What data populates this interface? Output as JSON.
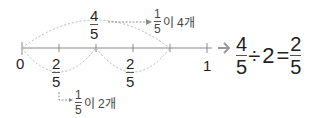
{
  "number_line": {
    "ticks": [
      {
        "x": 22,
        "label": "0"
      },
      {
        "x": 59,
        "label": ""
      },
      {
        "x": 96,
        "label": ""
      },
      {
        "x": 133,
        "label": ""
      },
      {
        "x": 170,
        "label": ""
      },
      {
        "x": 207,
        "label": "1"
      }
    ],
    "zero_label": "0",
    "one_label": "1",
    "lower_fractions": [
      {
        "numerator": "2",
        "denominator": "5"
      },
      {
        "numerator": "2",
        "denominator": "5"
      }
    ],
    "upper_fraction": {
      "numerator": "4",
      "denominator": "5"
    }
  },
  "annotations": {
    "top": {
      "numerator": "1",
      "denominator": "5",
      "suffix": "이 4개"
    },
    "bottom": {
      "numerator": "1",
      "denominator": "5",
      "suffix": "이 2개"
    }
  },
  "equation": {
    "left": {
      "numerator": "4",
      "denominator": "5"
    },
    "operator": "÷",
    "divisor": "2",
    "equals": "=",
    "right": {
      "numerator": "2",
      "denominator": "5"
    }
  },
  "colors": {
    "line": "#8a8a8a",
    "arc": "#b5b5b5",
    "text": "#1f1f1f",
    "arrow": "#9a9a9a"
  }
}
